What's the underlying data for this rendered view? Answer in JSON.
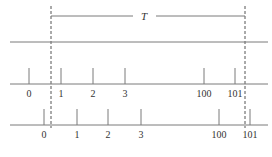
{
  "diagram": {
    "title_label": "T",
    "colors": {
      "line": "#7a7a7a",
      "dash": "#555555",
      "text": "#333333"
    },
    "period": {
      "x_start": 51,
      "x_end": 245,
      "bracket_y": 16,
      "label_x": 144
    },
    "top_line": {
      "y": 42,
      "x1": 10,
      "x2": 268
    },
    "rows": [
      {
        "name": "upper-timeline",
        "axis_y": 84,
        "tick_top": 68,
        "x1": 10,
        "x2": 268,
        "label_y": 97,
        "ticks": [
          {
            "label": "0",
            "x": 29
          },
          {
            "label": "1",
            "x": 61
          },
          {
            "label": "2",
            "x": 93
          },
          {
            "label": "3",
            "x": 125
          },
          {
            "label": "100",
            "x": 204
          },
          {
            "label": "101",
            "x": 235
          }
        ]
      },
      {
        "name": "lower-timeline",
        "axis_y": 125,
        "tick_top": 109,
        "x1": 10,
        "x2": 268,
        "label_y": 138,
        "ticks": [
          {
            "label": "0",
            "x": 44
          },
          {
            "label": "1",
            "x": 77
          },
          {
            "label": "2",
            "x": 108
          },
          {
            "label": "3",
            "x": 141
          },
          {
            "label": "100",
            "x": 219
          },
          {
            "label": "101",
            "x": 250
          }
        ]
      }
    ]
  }
}
